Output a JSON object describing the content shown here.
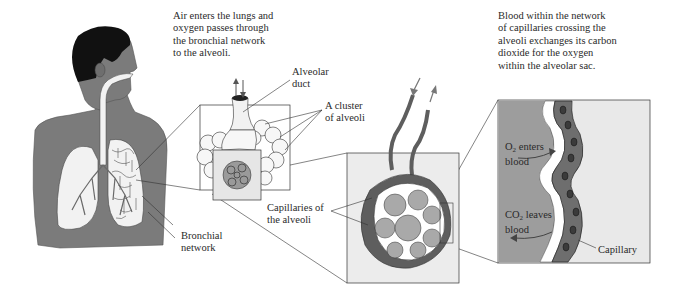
{
  "diagram": {
    "captions": {
      "airway": "Air enters the lungs and\noxygen passes through\nthe bronchial network\nto the alveoli.",
      "exchange": "Blood within the network\nof capillaries crossing the\nalveoli exchanges its carbon\ndioxide for the oxygen\nwithin the alveolar sac."
    },
    "labels": {
      "alveolar_duct": "Alveolar\nduct",
      "alveoli_cluster": "A cluster\nof alveoli",
      "bronchial_network": "Bronchial\nnetwork",
      "capillaries": "Capillaries of\nthe alveoli",
      "o2": {
        "prefix": "O",
        "sub": "2",
        "suffix": " enters\nblood"
      },
      "co2": {
        "prefix": "CO",
        "sub": "2",
        "suffix": " leaves\nblood"
      },
      "capillary": "Capillary"
    },
    "panels": [
      {
        "id": "torso",
        "description": "Human head and torso with lungs and bronchial tree"
      },
      {
        "id": "alveolar-cluster",
        "description": "Alveolar duct ending in a cluster of alveoli"
      },
      {
        "id": "capillary-network",
        "description": "Alveoli wrapped by capillaries with blood in/out vessels"
      },
      {
        "id": "capillary-closeup",
        "description": "Close-up of capillary wall next to alveolar sac"
      }
    ],
    "colors": {
      "body": "#7b7b7b",
      "hair": "#111111",
      "lung": "#f2f2f2",
      "box_fill": "#ececec",
      "alveolus_fill": "#a9a9a9",
      "capillary": "#5e5e5e",
      "closeup_fill": "#9d9d9d",
      "line": "#333333"
    }
  }
}
